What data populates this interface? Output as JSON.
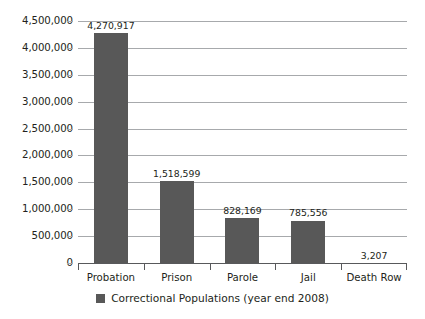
{
  "chart_data": {
    "type": "bar",
    "title": "",
    "subtitle": "",
    "xlabel": "",
    "ylabel": "",
    "categories": [
      "Probation",
      "Prison",
      "Parole",
      "Jail",
      "Death Row"
    ],
    "values": [
      4270917,
      1518599,
      828169,
      785556,
      3207
    ],
    "value_labels": [
      "4,270,917",
      "1,518,599",
      "828,169",
      "785,556",
      "3,207"
    ],
    "series": [
      {
        "name": "Correctional Populations (year end 2008)",
        "values": [
          4270917,
          1518599,
          828169,
          785556,
          3207
        ],
        "color": "#585858"
      }
    ],
    "ylim": [
      0,
      4500000
    ],
    "ytick_values": [
      0,
      500000,
      1000000,
      1500000,
      2000000,
      2500000,
      3000000,
      3500000,
      4000000,
      4500000
    ],
    "ytick_labels": [
      "0",
      "500,000",
      "1,000,000",
      "1,500,000",
      "2,000,000",
      "2,500,000",
      "3,000,000",
      "3,500,000",
      "4,000,000",
      "4,500,000"
    ],
    "grid": true,
    "grid_axis": "y",
    "grid_color": "#a7a9ac",
    "legend_position": "bottom",
    "legend_entries": [
      {
        "label": "Correctional Populations (year end 2008)",
        "color": "#585858"
      }
    ],
    "background_color": "#ffffff",
    "axis_color": "#58595b",
    "text_color": "#231f20",
    "data_labels_shown": true
  }
}
